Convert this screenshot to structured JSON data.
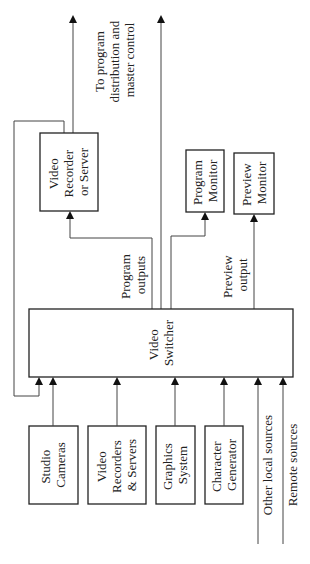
{
  "diagram": {
    "switcher": {
      "lines": [
        "Video",
        "Switcher"
      ]
    },
    "recorder": {
      "lines": [
        "Video",
        "Recorder",
        "or Server"
      ]
    },
    "program_monitor": {
      "lines": [
        "Program",
        "Monitor"
      ]
    },
    "preview_monitor": {
      "lines": [
        "Preview",
        "Monitor"
      ]
    },
    "program_outputs": {
      "lines": [
        "Program",
        "outputs"
      ]
    },
    "preview_output": {
      "lines": [
        "Preview",
        "output"
      ]
    },
    "distribution": {
      "lines": [
        "To program",
        "distribution and",
        "master control"
      ]
    },
    "sources": [
      {
        "lines": [
          "Studio",
          "Cameras"
        ]
      },
      {
        "lines": [
          "Video",
          "Recorders",
          "& Servers"
        ]
      },
      {
        "lines": [
          "Graphics",
          "System"
        ]
      },
      {
        "lines": [
          "Character",
          "Generator"
        ]
      }
    ],
    "other_local": "Other local sources",
    "remote": "Remote sources"
  }
}
